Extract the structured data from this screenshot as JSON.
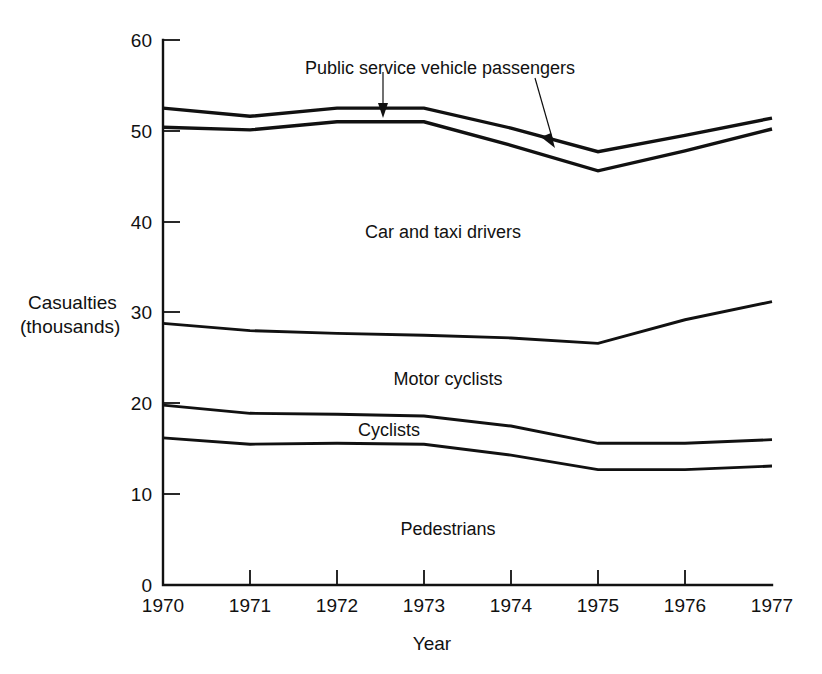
{
  "chart_data": {
    "type": "line",
    "title": "",
    "subtitle": "",
    "xlabel": "Year",
    "ylabel": "Casualties (thousands)",
    "ylabel_line1": "Casualties",
    "ylabel_line2": "(thousands)",
    "x": [
      1970,
      1971,
      1972,
      1973,
      1974,
      1975,
      1976,
      1977
    ],
    "categories": [
      "1970",
      "1971",
      "1972",
      "1973",
      "1974",
      "1975",
      "1976",
      "1977"
    ],
    "xlim": [
      1970,
      1977
    ],
    "ylim": [
      0,
      60
    ],
    "y_ticks": [
      0,
      10,
      20,
      30,
      40,
      50,
      60
    ],
    "y_tick_labels": [
      "0",
      "10",
      "20",
      "30",
      "40",
      "50",
      "60"
    ],
    "x_ticks": [
      1970,
      1971,
      1972,
      1973,
      1974,
      1975,
      1976,
      1977
    ],
    "grid": false,
    "legend": "none",
    "note": "Cumulative boundary lines of a stacked band chart; each series value is the upper boundary height in thousands of casualties.",
    "series": [
      {
        "name": "Public service vehicle passengers",
        "role": "upper boundary of top band",
        "values": [
          52.5,
          51.6,
          52.5,
          52.5,
          50.3,
          47.7,
          49.5,
          51.4
        ]
      },
      {
        "name": "Car and taxi drivers",
        "role": "upper boundary of car and taxi drivers band",
        "values": [
          50.4,
          50.1,
          51.0,
          51.0,
          48.4,
          45.6,
          47.8,
          50.2
        ]
      },
      {
        "name": "Motor cyclists",
        "role": "upper boundary of motor cyclists band",
        "values": [
          28.8,
          28.0,
          27.7,
          27.5,
          27.2,
          26.6,
          29.2,
          31.2
        ]
      },
      {
        "name": "Cyclists",
        "role": "upper boundary of cyclists band",
        "values": [
          19.8,
          18.9,
          18.8,
          18.6,
          17.5,
          15.6,
          15.6,
          16.0
        ]
      },
      {
        "name": "Pedestrians",
        "role": "upper boundary of pedestrians band",
        "values": [
          16.2,
          15.5,
          15.6,
          15.5,
          14.3,
          12.7,
          12.7,
          13.1
        ]
      }
    ],
    "band_labels": [
      {
        "text": "Public service vehicle passengers",
        "x": 1974.0,
        "y": 56.5,
        "annotated": true
      },
      {
        "text": "Car and taxi drivers",
        "x": 1973.2,
        "y": 38.0,
        "annotated": false
      },
      {
        "text": "Motor cyclists",
        "x": 1973.4,
        "y": 22.0,
        "annotated": false
      },
      {
        "text": "Cyclists",
        "x": 1973.3,
        "y": 16.8,
        "annotated": false
      },
      {
        "text": "Pedestrians",
        "x": 1973.4,
        "y": 6.5,
        "annotated": false
      }
    ],
    "annotations": [
      {
        "text": "leader to public service vehicle passengers band",
        "from_year": 1972.5,
        "to_year": 1972.5
      },
      {
        "text": "leader to car and taxi drivers band",
        "from_year": 1974.6,
        "to_year": 1974.3
      }
    ],
    "colors": {
      "line": "#111111",
      "axis": "#111111",
      "text": "#111111",
      "background": "#ffffff"
    }
  }
}
